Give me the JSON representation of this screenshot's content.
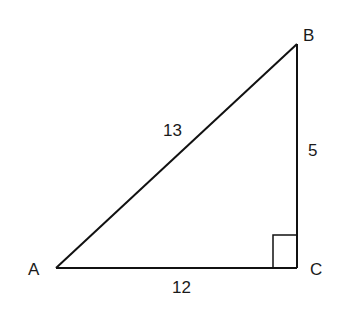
{
  "diagram": {
    "type": "right-triangle",
    "stroke_color": "#111111",
    "vertices": {
      "A": {
        "label": "A",
        "x": 56,
        "y": 268
      },
      "B": {
        "label": "B",
        "x": 297,
        "y": 44
      },
      "C": {
        "label": "C",
        "x": 297,
        "y": 268
      }
    },
    "sides": {
      "AB": {
        "label": "13"
      },
      "BC": {
        "label": "5"
      },
      "AC": {
        "label": "12"
      }
    },
    "right_angle_at": "C"
  }
}
